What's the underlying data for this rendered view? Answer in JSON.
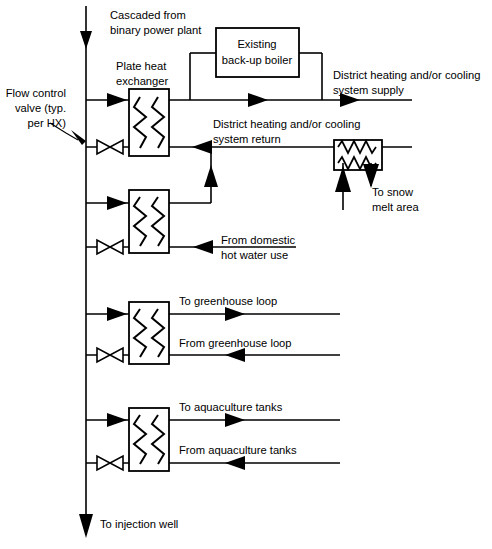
{
  "diagram": {
    "colors": {
      "line": "#000000",
      "background": "#ffffff",
      "box_fill": "#ffffff"
    },
    "labels": {
      "cascaded_line1": "Cascaded from",
      "cascaded_line2": "binary power plant",
      "plate_hx_line1": "Plate heat",
      "plate_hx_line2": "exchanger",
      "flow_valve_line1": "Flow control",
      "flow_valve_line2": "valve (typ.",
      "flow_valve_line3": "per HX)",
      "boiler_line1": "Existing",
      "boiler_line2": "back-up boiler",
      "supply_line1": "District heating and/or cooling",
      "supply_line2": "system supply",
      "return_line1": "District heating and/or cooling",
      "return_line2": "system return",
      "snow_melt_line1": "To snow",
      "snow_melt_line2": "melt area",
      "domestic_line1": "From domestic",
      "domestic_line2": "hot water use",
      "to_greenhouse": "To greenhouse loop",
      "from_greenhouse": "From greenhouse loop",
      "to_aquaculture": "To aquaculture tanks",
      "from_aquaculture": "From aquaculture tanks",
      "injection_well": "To injection well"
    },
    "components": [
      {
        "name": "plate-heat-exchanger-1",
        "label": "Plate heat exchanger"
      },
      {
        "name": "plate-heat-exchanger-2",
        "label": "Plate heat exchanger"
      },
      {
        "name": "plate-heat-exchanger-3",
        "label": "Plate heat exchanger"
      },
      {
        "name": "plate-heat-exchanger-4",
        "label": "Plate heat exchanger"
      },
      {
        "name": "snow-melt-heat-exchanger",
        "label": "Snow melt heat exchanger"
      },
      {
        "name": "backup-boiler",
        "label": "Existing back-up boiler"
      }
    ],
    "valves": [
      {
        "name": "flow-control-valve-1"
      },
      {
        "name": "flow-control-valve-2"
      },
      {
        "name": "flow-control-valve-3"
      },
      {
        "name": "flow-control-valve-4"
      }
    ]
  }
}
